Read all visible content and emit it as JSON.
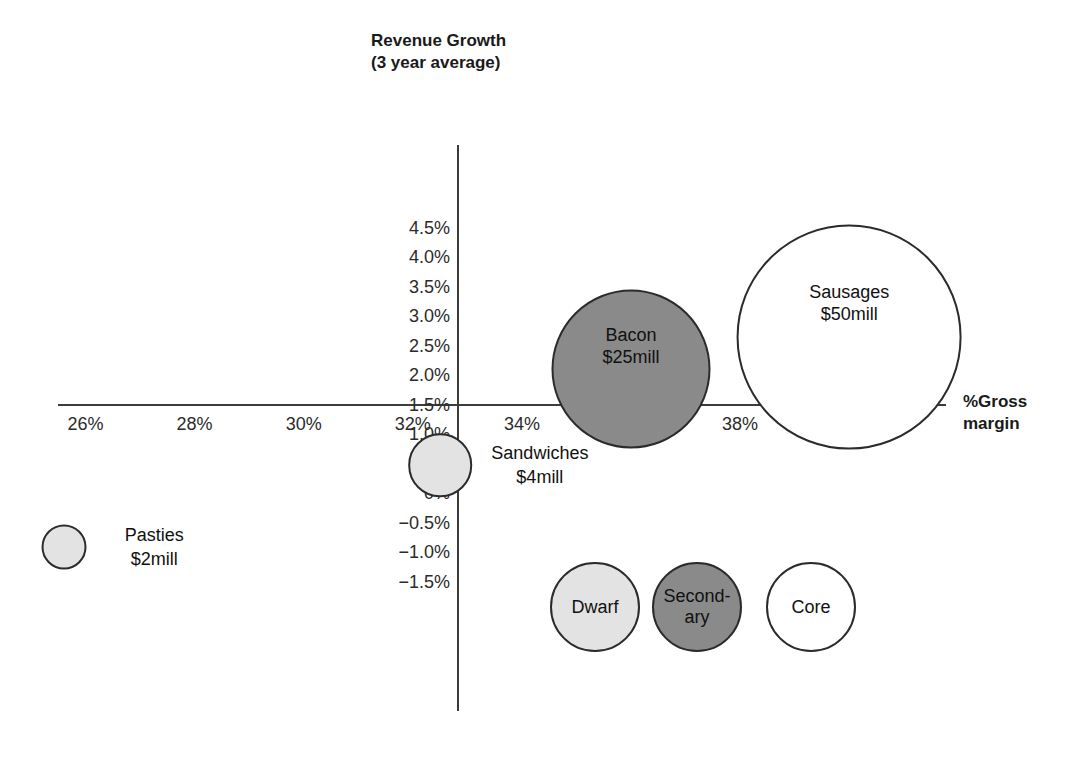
{
  "chart_data": {
    "type": "scatter",
    "title": "",
    "ylabel": "Revenue Growth\n(3 year average)",
    "ylabel_line1": "Revenue Growth",
    "ylabel_line2": "(3 year average)",
    "xlabel": "%Gross margin",
    "xlabel_line1": "%Gross",
    "xlabel_line2": "margin",
    "xlim": [
      25,
      41
    ],
    "ylim": [
      -1.75,
      4.75
    ],
    "grid": false,
    "legend_position": "bottom-center",
    "x_ticks": [
      "26%",
      "28%",
      "30%",
      "32%",
      "34%",
      "36%",
      "38%",
      "40%"
    ],
    "x_tick_values": [
      26,
      28,
      30,
      32,
      34,
      36,
      38,
      40
    ],
    "y_ticks": [
      "4.5%",
      "4.0%",
      "3.5%",
      "3.0%",
      "2.5%",
      "2.0%",
      "1.5%",
      "1.0%",
      "0.5%",
      "0%",
      "−0.5%",
      "−1.0%",
      "−1.5%"
    ],
    "y_tick_values": [
      4.5,
      4.0,
      3.5,
      3.0,
      2.5,
      2.0,
      1.5,
      1.0,
      0.5,
      0.0,
      -0.5,
      -1.0,
      -1.5
    ],
    "bubbles": [
      {
        "name": "Sausages",
        "size_label": "$50mill",
        "size_value": 50,
        "x": 40.0,
        "y": 2.65,
        "category": "Core",
        "fill": "#ffffff",
        "stroke": "#2b2b2b",
        "label_inside": true
      },
      {
        "name": "Bacon",
        "size_label": "$25mill",
        "size_value": 25,
        "x": 36.0,
        "y": 2.1,
        "category": "Secondary",
        "fill": "#8a8a8a",
        "stroke": "#2b2b2b",
        "label_inside": true
      },
      {
        "name": "Sandwiches",
        "size_label": "$4mill",
        "size_value": 4,
        "x": 32.5,
        "y": 0.47,
        "category": "Dwarf",
        "fill": "#e3e3e3",
        "stroke": "#2b2b2b",
        "label_inside": false
      },
      {
        "name": "Pasties",
        "size_label": "$2mill",
        "size_value": 2,
        "x": 25.6,
        "y": -0.92,
        "category": "Dwarf",
        "fill": "#e3e3e3",
        "stroke": "#2b2b2b",
        "label_inside": false
      }
    ],
    "legend": [
      {
        "label": "Dwarf",
        "fill": "#e3e3e3",
        "stroke": "#2b2b2b"
      },
      {
        "label": "Second-\nary",
        "label_line1": "Second-",
        "label_line2": "ary",
        "fill": "#8a8a8a",
        "stroke": "#2b2b2b"
      },
      {
        "label": "Core",
        "fill": "#ffffff",
        "stroke": "#2b2b2b"
      }
    ]
  },
  "colors": {
    "axis": "#3c3c3c",
    "text": "#1a1a1a",
    "dwarf": "#e3e3e3",
    "secondary": "#8a8a8a",
    "core": "#ffffff",
    "background": "#ffffff"
  }
}
